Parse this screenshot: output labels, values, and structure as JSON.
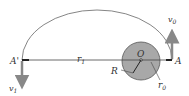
{
  "diagram": {
    "colors": {
      "background": "#ffffff",
      "planet_fill": "#a8a8a8",
      "planet_stroke": "#555555",
      "line": "#444444",
      "arrow": "#888888",
      "text": "#333333"
    },
    "labels": {
      "point_a": "A",
      "point_a_prime": "A'",
      "center": "O",
      "r1_base": "r",
      "r1_sub": "1",
      "r0_base": "r",
      "r0_sub": "0",
      "radius": "R",
      "v0_base": "v",
      "v0_sub": "0",
      "v1_base": "v",
      "v1_sub": "1"
    }
  }
}
